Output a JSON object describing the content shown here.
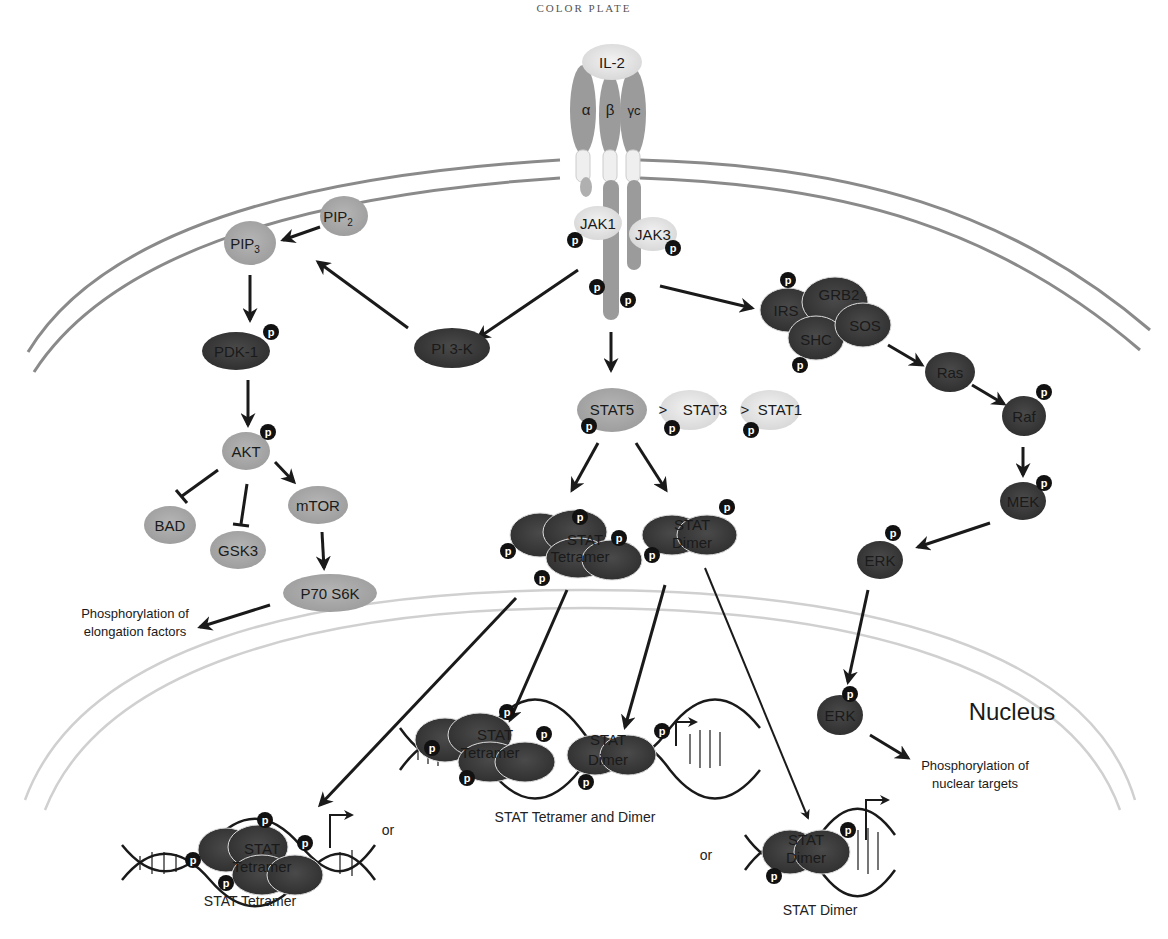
{
  "header": {
    "text": "COLOR PLATE"
  },
  "colors": {
    "light_node": "#e3e3e3",
    "mid_node": "#a9a9a9",
    "dark_node": "#3f3f3f",
    "receptor": "#9b9b9b",
    "membrane": "#8a8a8a",
    "nuclear_membrane": "#d0d0d0",
    "phospho": "#111111"
  },
  "receptor": {
    "ligand": "IL-2",
    "chains": [
      "α",
      "β",
      "γc"
    ],
    "kinases": [
      "JAK1",
      "JAK3"
    ]
  },
  "pi3k_pathway": {
    "pi3k": "PI 3-K",
    "pip2": "PIP",
    "pip2_sub": "2",
    "pip3": "PIP",
    "pip3_sub": "3",
    "pdk1": "PDK-1",
    "akt": "AKT",
    "bad": "BAD",
    "gsk3": "GSK3",
    "mtor": "mTOR",
    "p70s6k": "P70 S6K",
    "outcome_line1": "Phosphorylation of",
    "outcome_line2": "elongation factors"
  },
  "stat_pathway": {
    "stat5": "STAT5",
    "stat3": "STAT3",
    "stat1": "STAT1",
    "gt": ">",
    "tetramer_line1": "STAT",
    "tetramer_line2": "Tetramer",
    "dimer_line1": "STAT",
    "dimer_line2": "Dimer"
  },
  "mapk_pathway": {
    "irs": "IRS",
    "grb2": "GRB2",
    "shc": "SHC",
    "sos": "SOS",
    "ras": "Ras",
    "raf": "Raf",
    "mek": "MEK",
    "erk": "ERK",
    "outcome_line1": "Phosphorylation of",
    "outcome_line2": "nuclear targets"
  },
  "nucleus": {
    "label": "Nucleus",
    "captions": {
      "tetramer": "STAT Tetramer",
      "tetramer_and_dimer": "STAT Tetramer and Dimer",
      "dimer": "STAT Dimer"
    },
    "or": "or"
  },
  "phospho_label": "p"
}
